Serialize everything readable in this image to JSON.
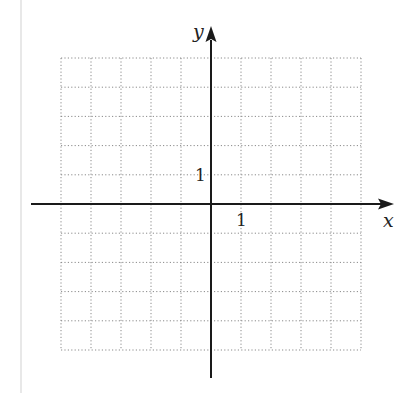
{
  "chart_data": {
    "type": "coordinate-grid",
    "title": "",
    "xlabel": "x",
    "ylabel": "y",
    "xlim": [
      -5,
      5
    ],
    "ylim": [
      -5,
      5
    ],
    "grid": true,
    "grid_style": "dotted",
    "tick_labels": {
      "x": [
        {
          "value": 1,
          "label": "1"
        }
      ],
      "y": [
        {
          "value": 1,
          "label": "1"
        }
      ]
    },
    "series": []
  },
  "labels": {
    "x_axis": "x",
    "y_axis": "y",
    "x_tick": "1",
    "y_tick": "1"
  },
  "colors": {
    "axis": "#1a1a1a",
    "grid": "#8a8a8a",
    "margin_rule": "#e6e6e6"
  }
}
